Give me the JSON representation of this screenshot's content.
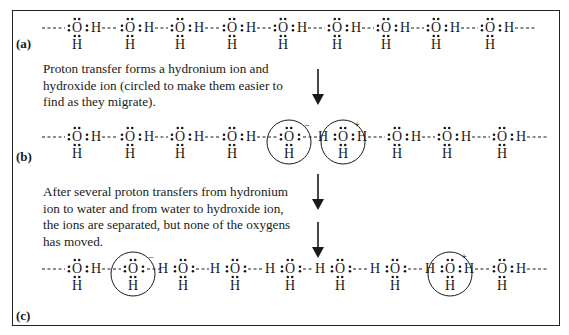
{
  "diagram": {
    "type": "chemistry-lewis-structures",
    "panels": [
      {
        "id": "a",
        "label": "(a)",
        "description": "Chain of hydrogen-bonded water molecules",
        "molecules": [
          {
            "o_x": 77,
            "type": "water"
          },
          {
            "o_x": 130,
            "type": "water"
          },
          {
            "o_x": 180,
            "type": "water"
          },
          {
            "o_x": 232,
            "type": "water"
          },
          {
            "o_x": 283,
            "type": "water"
          },
          {
            "o_x": 337,
            "type": "water"
          },
          {
            "o_x": 386,
            "type": "water"
          },
          {
            "o_x": 436,
            "type": "water"
          },
          {
            "o_x": 490,
            "type": "water"
          }
        ]
      },
      {
        "id": "b",
        "label": "(b)",
        "molecules": [
          {
            "o_x": 77,
            "type": "water"
          },
          {
            "o_x": 130,
            "type": "water"
          },
          {
            "o_x": 180,
            "type": "water"
          },
          {
            "o_x": 232,
            "type": "water"
          },
          {
            "o_x": 289,
            "type": "hydroxide",
            "charge": "−",
            "circled": true
          },
          {
            "o_x": 343,
            "type": "hydronium",
            "charge": "+",
            "circled": true
          },
          {
            "o_x": 397,
            "type": "water"
          },
          {
            "o_x": 447,
            "type": "water"
          },
          {
            "o_x": 502,
            "type": "water"
          }
        ]
      },
      {
        "id": "c",
        "label": "(c)",
        "molecules": [
          {
            "o_x": 77,
            "type": "water"
          },
          {
            "o_x": 133,
            "type": "hydroxide",
            "charge": "−",
            "circled": true
          },
          {
            "o_x": 183,
            "type": "water-flipped"
          },
          {
            "o_x": 235,
            "type": "water-flipped"
          },
          {
            "o_x": 290,
            "type": "water-flipped"
          },
          {
            "o_x": 340,
            "type": "water-flipped"
          },
          {
            "o_x": 395,
            "type": "water-flipped"
          },
          {
            "o_x": 450,
            "type": "hydronium",
            "charge": "+",
            "circled": true
          },
          {
            "o_x": 502,
            "type": "water"
          }
        ]
      }
    ],
    "captions": {
      "step1": [
        "Proton transfer forms a hydronium ion and",
        "hydroxide ion (circled to make them easier to",
        "find as they migrate)."
      ],
      "step2": [
        "After several proton transfers from hydronium",
        "ion to water and from water to hydroxide ion,",
        "the ions are separated, but none of the oxygens",
        "has moved."
      ]
    },
    "atoms": {
      "oxygen": "O",
      "hydrogen": "H"
    },
    "charges": {
      "negative": "−",
      "positive": "+"
    },
    "arrows": [
      {
        "x": 318,
        "y_top": 69,
        "y_bottom": 104,
        "direction": "down"
      },
      {
        "x": 318,
        "y_top": 174,
        "y_bottom": 209,
        "direction": "down"
      },
      {
        "x": 318,
        "y_top": 222,
        "y_bottom": 257,
        "direction": "down"
      }
    ],
    "colors": {
      "ink": "#1a1a1a",
      "background": "#ffffff",
      "frame": "#222222"
    }
  }
}
